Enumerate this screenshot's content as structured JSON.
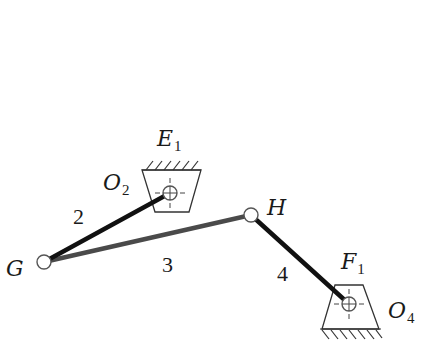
{
  "diagram": {
    "type": "four-bar linkage",
    "colors": {
      "link_2": "#111111",
      "link_3": "#4a4a4a",
      "link_4": "#111111",
      "outline": "#333333"
    },
    "labels": {
      "E1": {
        "main": "E",
        "sub": "1"
      },
      "O2": {
        "main": "O",
        "sub": "2"
      },
      "F1": {
        "main": "F",
        "sub": "1"
      },
      "O4": {
        "main": "O",
        "sub": "4"
      },
      "G": "G",
      "H": "H",
      "link2": "2",
      "link3": "3",
      "link4": "4"
    },
    "points": {
      "O2": [
        170,
        193
      ],
      "G": [
        44,
        262
      ],
      "H": [
        251,
        215
      ],
      "O4": [
        349,
        304
      ]
    },
    "links": [
      {
        "id": "2",
        "from": "O2",
        "to": "G"
      },
      {
        "id": "3",
        "from": "G",
        "to": "H"
      },
      {
        "id": "4",
        "from": "H",
        "to": "O4"
      }
    ],
    "supports": [
      {
        "id": "E1",
        "ground": "top",
        "pivot": "O2"
      },
      {
        "id": "F1",
        "ground": "bottom",
        "pivot": "O4"
      }
    ]
  }
}
